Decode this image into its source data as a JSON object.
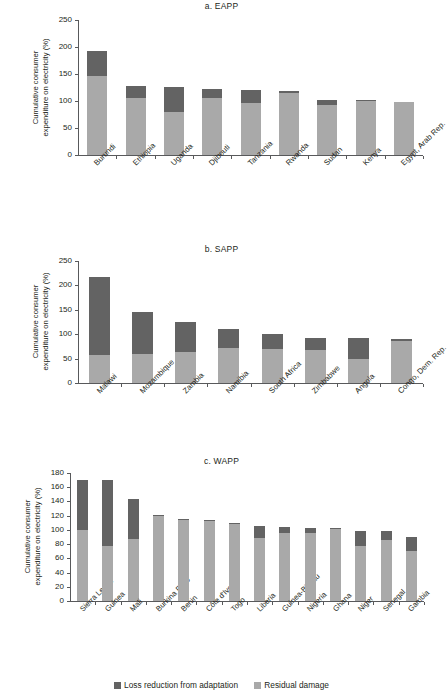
{
  "figure": {
    "ylabel": "Cumulative consumer expenditure on electricity (%)",
    "ylabel_line1": "Cumulative consumer",
    "ylabel_line2": "expenditure on electricity (%)",
    "colors": {
      "loss_reduction": "#636363",
      "residual_damage": "#a9a9a9",
      "axis": "#58595b",
      "text": "#231f20",
      "background": "#ffffff"
    }
  },
  "legend": {
    "position": "bottom-center",
    "items": [
      {
        "label": "Loss reduction from adaptation",
        "color": "#636363",
        "swatch_name": "loss-reduction-swatch"
      },
      {
        "label": "Residual damage",
        "color": "#a9a9a9",
        "swatch_name": "residual-damage-swatch"
      }
    ]
  },
  "chart_data": [
    {
      "type": "bar",
      "stacked": true,
      "title": "a. EAPP",
      "panel_id": "eapp",
      "xlabel": "",
      "ylabel": "Cumulative consumer expenditure on electricity (%)",
      "ylim": [
        0,
        250
      ],
      "yticks": [
        0,
        50,
        100,
        150,
        200,
        250
      ],
      "grid": false,
      "legend_position": "figure-bottom",
      "categories": [
        "Burundi",
        "Ethiopia",
        "Uganda",
        "Djibouti",
        "Tanzania",
        "Rwanda",
        "Sudan",
        "Kenya",
        "Egypt, Arab Rep."
      ],
      "series": [
        {
          "name": "Residual damage",
          "color": "#a9a9a9",
          "values": [
            147,
            105,
            79,
            105,
            96,
            115,
            92,
            100,
            99
          ]
        },
        {
          "name": "Loss reduction from adaptation",
          "color": "#636363",
          "values": [
            46,
            22,
            47,
            18,
            25,
            4,
            9,
            1,
            0
          ]
        }
      ],
      "totals": [
        193,
        127,
        126,
        123,
        121,
        119,
        101,
        101,
        99
      ]
    },
    {
      "type": "bar",
      "stacked": true,
      "title": "b. SAPP",
      "panel_id": "sapp",
      "xlabel": "",
      "ylabel": "Cumulative consumer expenditure on electricity (%)",
      "ylim": [
        0,
        250
      ],
      "yticks": [
        0,
        50,
        100,
        150,
        200,
        250
      ],
      "grid": false,
      "legend_position": "figure-bottom",
      "categories": [
        "Malawi",
        "Mozambique",
        "Zambia",
        "Namibia",
        "South Africa",
        "Zimbabwe",
        "Angola",
        "Congo, Dem. Rep."
      ],
      "series": [
        {
          "name": "Residual damage",
          "color": "#a9a9a9",
          "values": [
            57,
            60,
            64,
            71,
            70,
            68,
            50,
            86
          ]
        },
        {
          "name": "Loss reduction from adaptation",
          "color": "#636363",
          "values": [
            161,
            85,
            62,
            39,
            31,
            25,
            42,
            5
          ]
        }
      ],
      "totals": [
        218,
        145,
        126,
        110,
        101,
        93,
        92,
        91
      ]
    },
    {
      "type": "bar",
      "stacked": true,
      "title": "c. WAPP",
      "panel_id": "wapp",
      "xlabel": "",
      "ylabel": "Cumulative consumer expenditure on electricity (%)",
      "ylim": [
        0,
        180
      ],
      "yticks": [
        0,
        20,
        40,
        60,
        80,
        100,
        120,
        140,
        160,
        180
      ],
      "grid": false,
      "legend_position": "figure-bottom",
      "categories": [
        "Sierra Leone",
        "Guinea",
        "Mali",
        "Burkina Faso",
        "Benin",
        "Côte d'Ivoire",
        "Togo",
        "Liberia",
        "Guinea-Bissau",
        "Nigeria",
        "Ghana",
        "Niger",
        "Senegal",
        "Gambia"
      ],
      "series": [
        {
          "name": "Residual damage",
          "color": "#a9a9a9",
          "values": [
            100,
            77,
            87,
            119,
            114,
            113,
            108,
            88,
            95,
            96,
            101,
            78,
            86,
            71
          ]
        },
        {
          "name": "Loss reduction from adaptation",
          "color": "#636363",
          "values": [
            70,
            93,
            57,
            2,
            1,
            1,
            1,
            17,
            9,
            7,
            1,
            21,
            13,
            19
          ]
        }
      ],
      "totals": [
        170,
        170,
        144,
        121,
        115,
        114,
        109,
        105,
        104,
        103,
        102,
        99,
        99,
        90
      ]
    }
  ]
}
